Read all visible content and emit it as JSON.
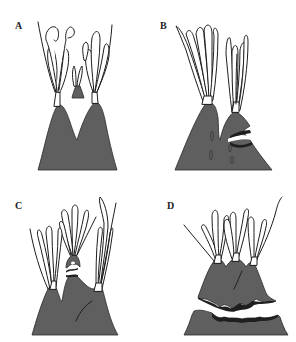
{
  "figure": {
    "type": "diagram",
    "colors": {
      "body": "#5f5f5f",
      "outline": "#1e1e1e",
      "background": "#ffffff"
    },
    "panels": [
      {
        "id": "A",
        "label": "A",
        "stage": "two peaks with tentacle crowns and a small detached bud"
      },
      {
        "id": "B",
        "label": "B",
        "stage": "two peaks, right peak showing a horizontal constriction"
      },
      {
        "id": "C",
        "label": "C",
        "stage": "three peaks, central bud separating at constriction"
      },
      {
        "id": "D",
        "label": "D",
        "stage": "upper bell-shaped portion with three crowns detached from lower base"
      }
    ]
  }
}
